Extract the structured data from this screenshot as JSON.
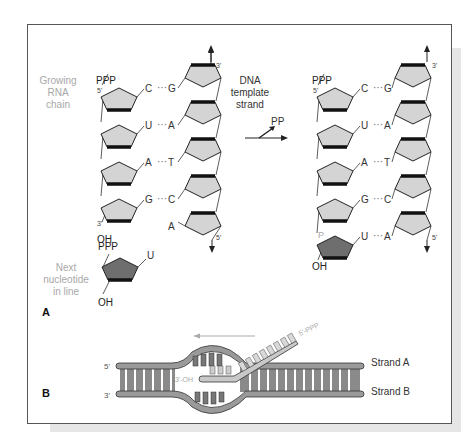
{
  "figure": {
    "panel_a": {
      "label": "A",
      "growing_rna_label": [
        "Growing",
        "RNA",
        "chain"
      ],
      "dna_template_label": [
        "DNA",
        "template",
        "strand"
      ],
      "next_nucleotide_label": [
        "Next",
        "nucleotide",
        "in line"
      ],
      "reaction_byproduct": "PP",
      "before": {
        "rna_5prime_group": "PPP",
        "rna_5prime_end": "5'",
        "rna_3prime_end": "3'",
        "rna_3prime_group": "OH",
        "dna_top_end": "3'",
        "dna_bottom_end": "5'",
        "pairs": [
          {
            "rna": "C",
            "dna": "G"
          },
          {
            "rna": "U",
            "dna": "A"
          },
          {
            "rna": "A",
            "dna": "T"
          },
          {
            "rna": "G",
            "dna": "C"
          },
          {
            "rna": "",
            "dna": "A"
          }
        ]
      },
      "next_nucleotide": {
        "phosphate_label": "PPP",
        "base": "U",
        "hydroxyl": "OH"
      },
      "after": {
        "rna_5prime_group": "PPP",
        "rna_5prime_end": "5'",
        "new_phosphate": "P",
        "rna_3prime_group": "OH",
        "dna_top_end": "3'",
        "dna_bottom_end": "5'",
        "pairs": [
          {
            "rna": "C",
            "dna": "G"
          },
          {
            "rna": "U",
            "dna": "A"
          },
          {
            "rna": "A",
            "dna": "T"
          },
          {
            "rna": "G",
            "dna": "C"
          },
          {
            "rna": "U",
            "dna": "A"
          }
        ]
      }
    },
    "panel_b": {
      "label": "B",
      "strand_a_label": "Strand A",
      "strand_b_label": "Strand B",
      "left_top_end": "5'",
      "left_bottom_end": "3'",
      "rna_3prime": "3'-OH",
      "rna_5prime": "5'-PPP"
    },
    "colors": {
      "pentagon_fill": "#d4d4d4",
      "new_nucleotide_fill": "#6e6e6e",
      "duplex_fill": "#8a8a8a",
      "rna_fill": "#c8c8c8",
      "gray_label": "#a8a8a8"
    }
  }
}
